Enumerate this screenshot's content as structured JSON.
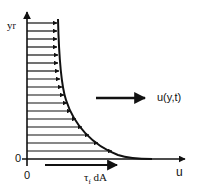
{
  "diagram": {
    "labels": {
      "y_axis": "y",
      "y_axis_sub": "r",
      "x_axis": "u",
      "origin_y": "0",
      "origin_x": "0",
      "profile": "u(y,t)",
      "shear": "τ",
      "shear_sub": "f",
      "shear_suffix": " dA"
    },
    "colors": {
      "ink": "#111111",
      "background": "#ffffff"
    }
  }
}
